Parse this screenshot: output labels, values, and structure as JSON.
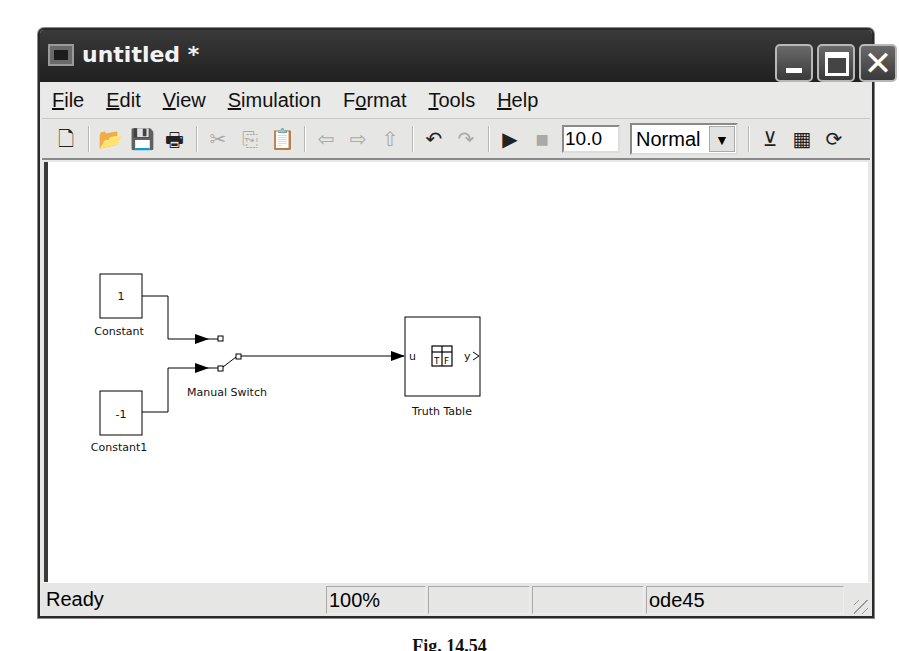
{
  "window": {
    "title": "untitled *",
    "controls": {
      "minimize": "_",
      "maximize": "□",
      "close": "✕"
    }
  },
  "menu": [
    {
      "label": "File",
      "mnemonic": "F",
      "rest": "ile"
    },
    {
      "label": "Edit",
      "mnemonic": "E",
      "rest": "dit"
    },
    {
      "label": "View",
      "mnemonic": "V",
      "rest": "iew"
    },
    {
      "label": "Simulation",
      "mnemonic": "S",
      "rest": "imulation"
    },
    {
      "label": "Format",
      "pre": "F",
      "mnemonic": "o",
      "rest": "rmat"
    },
    {
      "label": "Tools",
      "mnemonic": "T",
      "rest": "ools"
    },
    {
      "label": "Help",
      "mnemonic": "H",
      "rest": "elp"
    }
  ],
  "toolbar": {
    "icons": {
      "new": "🗋",
      "open": "📂",
      "save": "💾",
      "print": "🖶",
      "cut": "✂",
      "copy": "⎘",
      "paste": "📋",
      "back": "⇦",
      "forward": "⇨",
      "up": "⇧",
      "undo": "↶",
      "redo": "↷",
      "start": "▶",
      "stop": "■",
      "build": "⊻",
      "library": "▦",
      "refresh": "⟳"
    },
    "stop_time": "10.0",
    "sim_mode": "Normal"
  },
  "diagram": {
    "blocks": [
      {
        "id": "constant",
        "value": "1",
        "label": "Constant"
      },
      {
        "id": "constant1",
        "value": "-1",
        "label": "Constant1"
      },
      {
        "id": "manual_switch",
        "label": "Manual Switch"
      },
      {
        "id": "truth_table",
        "label": "Truth Table",
        "input_port": "u",
        "output_port": "y",
        "icon_text": "T F"
      }
    ]
  },
  "statusbar": {
    "status": "Ready",
    "zoom": "100%",
    "cell3": "",
    "cell4": "",
    "solver": "ode45"
  },
  "caption": "Fig. 14.54"
}
